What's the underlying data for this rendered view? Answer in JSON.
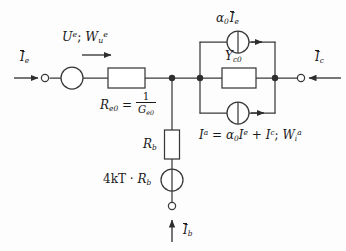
{
  "figure": {
    "kind": "circuit-schematic",
    "background_color": "#fdfdfd",
    "line_color": "#3a3a3a",
    "text_color": "#1a1a1a",
    "width": 346,
    "height": 251
  },
  "labels": {
    "input_current": "Ĩe",
    "input_current_base": "I",
    "input_current_sub": "e",
    "port_voltage_power": "Ue ; Wue",
    "port_voltage_base": "U",
    "port_voltage_sup": "e",
    "port_power_base": "W",
    "port_power_sub": "u",
    "port_power_sup": "e",
    "emitter_resistor_name": "Re0",
    "emitter_resistor_base": "R",
    "emitter_resistor_sub": "e0",
    "equals": "=",
    "emitter_resistor_value_num": "1",
    "emitter_resistor_value_den": "Ge0",
    "emitter_resistor_value_den_base": "G",
    "emitter_resistor_value_den_sub": "e0",
    "base_resistor": "Rb",
    "base_resistor_base": "R",
    "base_resistor_sub": "b",
    "thermal_noise_source": "4kT · Rb",
    "thermal_noise_prefix": "4kT",
    "thermal_noise_dot": "·",
    "thermal_noise_res_base": "R",
    "thermal_noise_res_sub": "b",
    "base_current": "Ĩb",
    "base_current_base": "I",
    "base_current_sub": "b",
    "controlled_source_top": "α0 Ĩe",
    "alpha": "α",
    "alpha_sub": "0",
    "ctrl_current_base": "I",
    "ctrl_current_sub": "e",
    "collector_admittance": "Yc0",
    "collector_admittance_base": "Y",
    "collector_admittance_sub": "c0",
    "noise_current_expr": "Ia = α0 Ie + Ic ; Wia",
    "noise_lhs_base": "I",
    "noise_lhs_sup": "a",
    "noise_rhs_alpha": "α",
    "noise_rhs_alpha_sub": "0",
    "noise_rhs_I1_base": "I",
    "noise_rhs_I1_sup": "e",
    "plus": "+",
    "noise_rhs_I2_base": "I",
    "noise_rhs_I2_sup": "c",
    "semicolon": ";",
    "noise_W_base": "W",
    "noise_W_sub": "i",
    "noise_W_sup": "a",
    "output_current": "Ĩc",
    "output_current_base": "I",
    "output_current_sub": "c"
  },
  "components": [
    {
      "id": "emitter-terminal",
      "type": "terminal",
      "x": 45,
      "y": 78
    },
    {
      "id": "emitter-source",
      "type": "current-source-circle",
      "cx": 72,
      "cy": 78,
      "r": 11
    },
    {
      "id": "emitter-resistor",
      "type": "resistor-box",
      "x": 108,
      "y": 68,
      "w": 37,
      "h": 20
    },
    {
      "id": "node-base",
      "type": "junction-dot",
      "x": 172,
      "y": 78
    },
    {
      "id": "node-collector-left",
      "type": "junction-dot",
      "x": 200,
      "y": 78
    },
    {
      "id": "base-resistor",
      "type": "resistor-box",
      "x": 165,
      "y": 130,
      "w": 15,
      "h": 29
    },
    {
      "id": "base-noise-source",
      "type": "source-circle",
      "cx": 172,
      "cy": 180,
      "r": 11
    },
    {
      "id": "base-terminal",
      "type": "terminal",
      "x": 172,
      "y": 207
    },
    {
      "id": "alpha-source-top",
      "type": "current-source-circle",
      "cx": 238,
      "cy": 42,
      "r": 11
    },
    {
      "id": "collector-admittance",
      "type": "admittance-box",
      "x": 222,
      "y": 68,
      "w": 34,
      "h": 20
    },
    {
      "id": "noise-source-bottom",
      "type": "current-source-circle",
      "cx": 238,
      "cy": 113,
      "r": 11
    },
    {
      "id": "node-collector-right",
      "type": "junction-dot",
      "x": 275,
      "y": 78
    },
    {
      "id": "collector-terminal",
      "type": "terminal",
      "x": 297,
      "y": 78
    }
  ],
  "arrows": [
    {
      "id": "input-current-arrow",
      "direction": "right",
      "x1": 14,
      "y": 78,
      "x2": 40
    },
    {
      "id": "port-power-arrow",
      "direction": "right",
      "x1": 80,
      "y": 55,
      "x2": 112
    },
    {
      "id": "alpha-source-arrow",
      "direction": "right",
      "x": 258,
      "y": 42
    },
    {
      "id": "noise-source-arrow",
      "direction": "right",
      "x": 262,
      "y": 113
    },
    {
      "id": "output-current-arrow",
      "direction": "left",
      "x1": 340,
      "y": 78,
      "x2": 307
    },
    {
      "id": "base-current-arrow",
      "direction": "up",
      "x": 172,
      "y1": 240,
      "y2": 218
    }
  ]
}
